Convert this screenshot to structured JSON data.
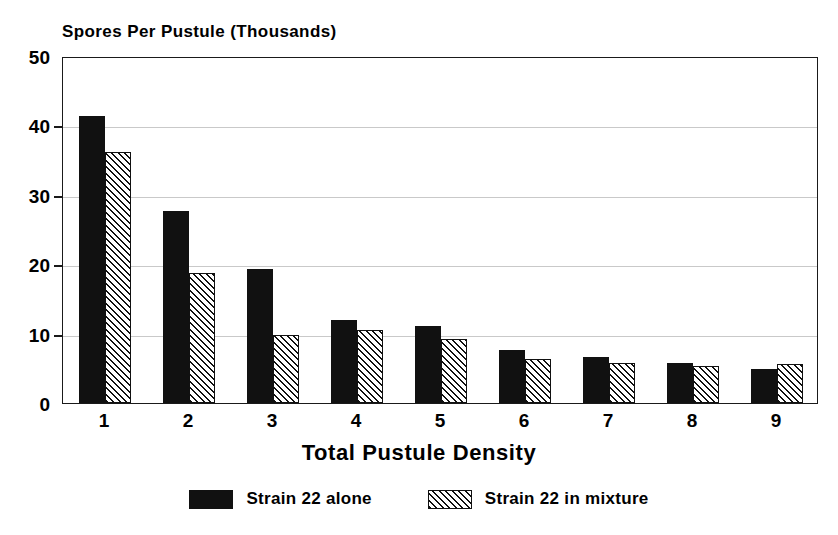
{
  "chart_data": {
    "type": "bar",
    "title": "Spores Per Pustule (Thousands)",
    "xlabel": "Total Pustule Density",
    "ylabel": "",
    "categories": [
      "1",
      "2",
      "3",
      "4",
      "5",
      "6",
      "7",
      "8",
      "9"
    ],
    "series": [
      {
        "name": "Strain 22 alone",
        "fill": "solid-black",
        "values": [
          41.3,
          27.7,
          19.3,
          11.9,
          11.1,
          7.6,
          6.7,
          5.8,
          4.9
        ]
      },
      {
        "name": "Strain 22 in mixture",
        "fill": "diagonal-hatch",
        "values": [
          36.1,
          18.8,
          9.8,
          10.5,
          9.2,
          6.3,
          5.7,
          5.4,
          5.6
        ]
      }
    ],
    "ylim": [
      0,
      50
    ],
    "yticks": [
      0,
      10,
      20,
      30,
      40,
      50
    ],
    "ytick_labels": [
      "0",
      "10",
      "20",
      "30",
      "40",
      "50"
    ],
    "grid": true,
    "grid_axis": "y",
    "legend_position": "bottom-center"
  },
  "legend": {
    "items": [
      {
        "label": "Strain 22 alone",
        "swatch": "solid"
      },
      {
        "label": "Strain 22 in mixture",
        "swatch": "hatched"
      }
    ]
  },
  "colors": {
    "series_1": "#111111",
    "series_2_outline": "#111111",
    "axis": "#1a1a1a",
    "gridline": "#c9c9c9",
    "background": "#ffffff"
  }
}
